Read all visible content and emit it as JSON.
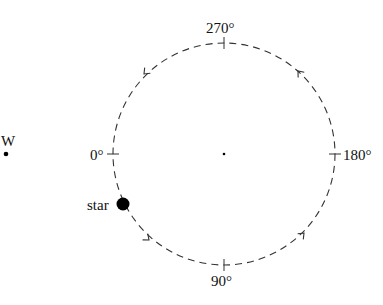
{
  "diagram": {
    "labels": {
      "deg270": "270°",
      "deg180": "180°",
      "deg90": "90°",
      "deg0": "0°",
      "star": "star",
      "w": "W"
    },
    "colors": {
      "stroke": "#333333",
      "ink": "#000000"
    },
    "orbit_style": "dashed",
    "orbit_direction": "counterclockwise-on-screen (top → left → bottom → right)",
    "star_angle_deg": 22
  }
}
